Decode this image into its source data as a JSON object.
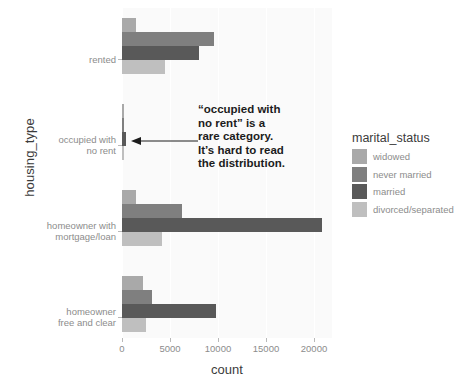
{
  "chart_data": {
    "type": "bar",
    "orientation": "horizontal",
    "title": "",
    "xlabel": "count",
    "ylabel": "housing_type",
    "xlim": [
      0,
      21875
    ],
    "xticks": [
      0,
      5000,
      10000,
      15000,
      20000
    ],
    "xticklabels": [
      "0",
      "5000",
      "10000",
      "15000",
      "20000"
    ],
    "grid": true,
    "grid_axis": "x",
    "legend_title": "marital_status",
    "legend_position": "right",
    "categories": [
      "rented",
      "occupied with no rent",
      "homeowner with mortgage/loan",
      "homeowner free and clear"
    ],
    "category_lines": [
      [
        "rented"
      ],
      [
        "occupied with",
        "no rent"
      ],
      [
        "homeowner with",
        "mortgage/loan"
      ],
      [
        "homeowner",
        "free and clear"
      ]
    ],
    "series": [
      {
        "name": "widowed",
        "color": "#a9a9a9",
        "values": [
          1500,
          180,
          1450,
          2200
        ]
      },
      {
        "name": "never married",
        "color": "#7f7f7f",
        "values": [
          9600,
          250,
          6300,
          3100
        ]
      },
      {
        "name": "married",
        "color": "#595959",
        "values": [
          8000,
          430,
          20800,
          9800
        ]
      },
      {
        "name": "divorced/separated",
        "color": "#bfbfbf",
        "values": [
          4500,
          200,
          4200,
          2500
        ]
      }
    ],
    "annotations": [
      {
        "name": "rare-category-note",
        "lines": [
          "“occupied with",
          "no rent” is a",
          "rare category.",
          "It’s hard to read",
          "the distribution."
        ],
        "arrow": "points-left-to-occupied-with-no-rent"
      }
    ],
    "colors": {
      "panel_background": "#fafafa",
      "gridline": "#ffffff",
      "figure_background": "#ffffff",
      "tick_label": "#8c8c8c",
      "axis_title": "#3b3b3b",
      "annotation_text": "#1c1c1c"
    }
  }
}
